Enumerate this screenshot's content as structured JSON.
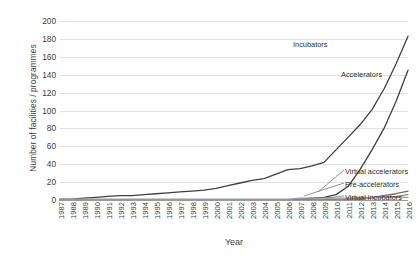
{
  "chart_data": {
    "type": "line",
    "title": "",
    "xlabel": "Year",
    "ylabel": "Number of facilities / programmes",
    "ylim": [
      0,
      200
    ],
    "ytick_step": 20,
    "yticks": [
      0,
      20,
      40,
      60,
      80,
      100,
      120,
      140,
      160,
      180,
      200
    ],
    "grid": true,
    "legend_position": "inline-annotations",
    "categories": [
      "1987",
      "1988",
      "1989",
      "1990",
      "1991",
      "1992",
      "1993",
      "1994",
      "1995",
      "1996",
      "1997",
      "1998",
      "1999",
      "2000",
      "2001",
      "2002",
      "2003",
      "2004",
      "2005",
      "2006",
      "2007",
      "2008",
      "2009",
      "2010",
      "2011",
      "2012",
      "2013",
      "2014",
      "2015",
      "2016"
    ],
    "series": [
      {
        "name": "Incubators",
        "color": "#404040",
        "values": [
          1,
          1,
          2,
          3,
          4,
          5,
          5,
          6,
          7,
          8,
          9,
          10,
          11,
          13,
          16,
          19,
          22,
          24,
          29,
          34,
          35,
          38,
          42,
          56,
          70,
          84,
          101,
          124,
          152,
          183
        ]
      },
      {
        "name": "Accelerators",
        "color": "#404040",
        "values": [
          0,
          0,
          0,
          0,
          0,
          0,
          0,
          0,
          0,
          0,
          0,
          0,
          0,
          0,
          0,
          0,
          0,
          0,
          0,
          0,
          1,
          2,
          3,
          6,
          15,
          34,
          56,
          80,
          110,
          145
        ]
      },
      {
        "name": "Virtual accelerators",
        "color": "#6e6e6e",
        "values": [
          0,
          0,
          0,
          0,
          0,
          0,
          0,
          0,
          0,
          0,
          0,
          0,
          0,
          0,
          0,
          0,
          0,
          0,
          0,
          0,
          0,
          0,
          0,
          1,
          1,
          2,
          3,
          5,
          7,
          10
        ]
      },
      {
        "name": "Pre-accelerators",
        "color": "#8a8a8a",
        "values": [
          0,
          0,
          0,
          0,
          0,
          0,
          0,
          0,
          0,
          0,
          0,
          0,
          0,
          0,
          0,
          0,
          0,
          0,
          0,
          0,
          0,
          0,
          0,
          0,
          1,
          1,
          2,
          3,
          4,
          6
        ]
      },
      {
        "name": "Virtual incubators",
        "color": "#a0a0a0",
        "values": [
          1,
          1,
          1,
          1,
          1,
          1,
          1,
          1,
          1,
          1,
          1,
          1,
          1,
          1,
          1,
          1,
          1,
          1,
          1,
          1,
          2,
          2,
          2,
          2,
          2,
          3,
          3,
          3,
          3,
          3
        ]
      }
    ],
    "annotations": [
      {
        "text": "Incubators",
        "series": "Incubators"
      },
      {
        "text": "Accelerators",
        "series": "Accelerators"
      },
      {
        "text": "Virtual accelerators",
        "series": "Virtual accelerators"
      },
      {
        "text": "Pre-accelerators",
        "series": "Pre-accelerators"
      },
      {
        "text": "Virtual incubators",
        "series": "Virtual incubators"
      }
    ]
  }
}
